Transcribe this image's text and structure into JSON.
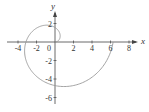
{
  "chart_data": {
    "type": "line",
    "title": "",
    "equation": "r = θ",
    "theta_range": [
      0,
      6.2832
    ],
    "xlabel": "x",
    "ylabel": "y",
    "xlim": [
      -4.5,
      9
    ],
    "ylim": [
      -6.6,
      3.6
    ],
    "x_ticks": [
      -4,
      -2,
      0,
      2,
      4,
      6,
      8
    ],
    "y_ticks": [
      2,
      -2,
      -4,
      -6
    ],
    "x_tick_labels": [
      "-4",
      "-2",
      "0",
      "2",
      "4",
      "6",
      "8"
    ],
    "y_tick_labels": [
      "2",
      "-2",
      "-4",
      "-6"
    ],
    "origin_label": "0",
    "grid": false,
    "legend": null,
    "key_points": [
      {
        "x": 0,
        "y": 0
      },
      {
        "x": 0,
        "y": 1.57
      },
      {
        "x": -3.14,
        "y": 0
      },
      {
        "x": 0,
        "y": -4.71
      },
      {
        "x": 6.28,
        "y": 0
      }
    ],
    "curve_color": "#999999",
    "axis_color": "#444444"
  }
}
